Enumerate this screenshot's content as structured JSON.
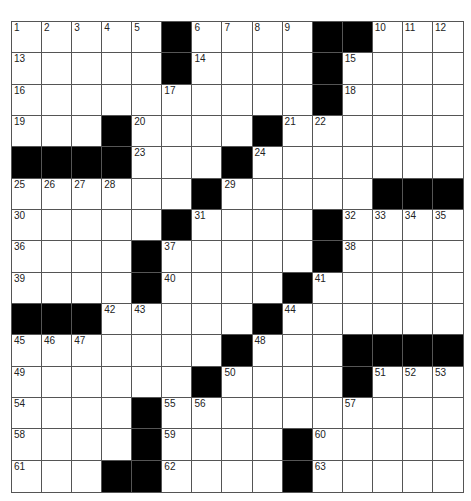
{
  "puzzle": {
    "rows": 15,
    "cols": 15,
    "colors": {
      "block": "#000000",
      "cell": "#ffffff",
      "line": "#555555"
    },
    "grid": [
      "01,02,03,04,05,#,06,07,08,09,#,#,10,11,12",
      "13,.,.,.,.,#,14,.,.,.,#,15,.,.,.",
      "16,.,.,.,.,17,.,.,.,.,#,18,.,.,.",
      "19,.,.,#,20,.,.,.,#,21,22,.,.,.,.",
      "#,#,#,#,23,.,.,#,24,.,.,.,.,.,.",
      "25,26,27,28,.,.,#,29,.,.,.,.,#,#,#",
      "30,.,.,.,.,#,31,.,.,.,#,32,33,34,35",
      "36,.,.,.,#,37,.,.,.,.,#,38,.,.,.",
      "39,.,.,.,#,40,.,.,.,#,41,.,.,.,.",
      "#,#,#,42,43,.,.,.,#,44,.,.,.,.,.",
      "45,46,47,.,.,.,.,#,48,.,.,#,#,#,#",
      "49,.,.,.,.,.,#,50,.,.,.,#,51,52,53",
      "54,.,.,.,#,55,56,.,.,.,.,57,.,.,.",
      "58,.,.,.,#,59,.,.,.,#,60,.,.,.,.",
      "61,.,.,#,#,62,.,.,.,#,63,.,.,.,."
    ]
  }
}
